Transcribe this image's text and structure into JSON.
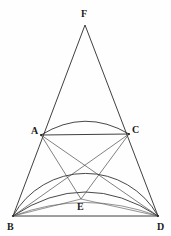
{
  "figure": {
    "background_color": "#fefefe",
    "stroke_color": "#2a2a2a",
    "width": 171,
    "height": 236,
    "points": [
      {
        "id": "F",
        "label": "F",
        "x": 85,
        "y": 25,
        "label_x": 81,
        "label_y": 9,
        "role": "apex"
      },
      {
        "id": "A",
        "label": "A",
        "x": 41,
        "y": 135,
        "label_x": 31,
        "label_y": 126,
        "role": "vertex-on-arc"
      },
      {
        "id": "C",
        "label": "C",
        "x": 129,
        "y": 134,
        "label_x": 132,
        "label_y": 125,
        "role": "vertex-on-arc"
      },
      {
        "id": "B",
        "label": "B",
        "x": 13,
        "y": 216,
        "label_x": 7,
        "label_y": 222,
        "role": "base-left"
      },
      {
        "id": "D",
        "label": "D",
        "x": 158,
        "y": 216,
        "label_x": 157,
        "label_y": 222,
        "role": "base-right"
      },
      {
        "id": "E",
        "label": "E",
        "x": 81,
        "y": 199,
        "label_x": 77,
        "label_y": 202,
        "role": "interior-point"
      }
    ],
    "segments": [
      {
        "id": "FB",
        "from": "F",
        "to": "B",
        "style": "main"
      },
      {
        "id": "FD",
        "from": "F",
        "to": "D",
        "style": "main"
      },
      {
        "id": "AC",
        "from": "A",
        "to": "C",
        "style": "main"
      },
      {
        "id": "BD",
        "from": "B",
        "to": "D",
        "style": "main"
      },
      {
        "id": "AD",
        "from": "A",
        "to": "D",
        "style": "thin"
      },
      {
        "id": "CB",
        "from": "C",
        "to": "B",
        "style": "thin"
      },
      {
        "id": "AB",
        "from": "A",
        "to": "B",
        "style": "thin"
      },
      {
        "id": "CD",
        "from": "C",
        "to": "D",
        "style": "thin"
      },
      {
        "id": "AE",
        "from": "A",
        "to": "E",
        "style": "thin"
      },
      {
        "id": "CE",
        "from": "C",
        "to": "E",
        "style": "thin"
      },
      {
        "id": "BE",
        "from": "B",
        "to": "E",
        "style": "faint"
      },
      {
        "id": "ED",
        "from": "E",
        "to": "D",
        "style": "faint"
      }
    ],
    "arcs": [
      {
        "id": "semicircle-BD",
        "description": "large semicircle on diameter BD through A and C",
        "from": "B",
        "to": "D",
        "sweep_peak_y": 133,
        "style": "arc"
      },
      {
        "id": "arc-AC",
        "description": "arc bulging above chord AC",
        "from": "A",
        "to": "C",
        "sweep_peak_y": 117,
        "style": "arc"
      },
      {
        "id": "arc-BD-upper",
        "description": "upper arc above chord BD",
        "from": "B",
        "to": "D",
        "sweep_peak_y": 192,
        "style": "arc"
      },
      {
        "id": "arc-BD-lower",
        "description": "lower arc above chord BD",
        "from": "B",
        "to": "D",
        "sweep_peak_y": 203,
        "style": "faint"
      }
    ]
  }
}
